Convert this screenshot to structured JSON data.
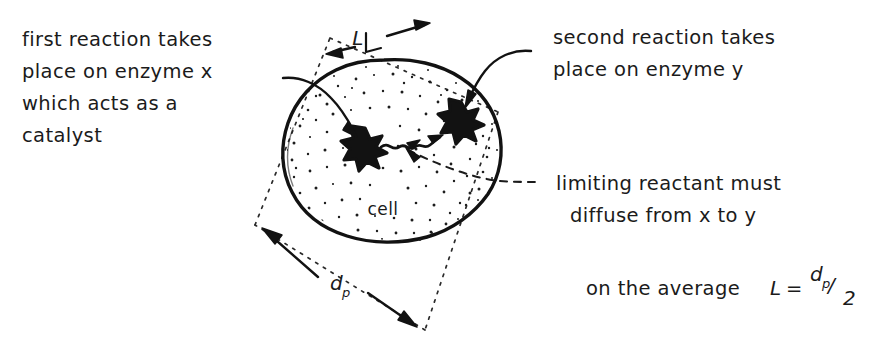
{
  "figure": {
    "ink_color": "#121212",
    "background_color": "#ffffff"
  },
  "annotations": {
    "left_note": {
      "name": "first-reaction-note",
      "lines": [
        "first reaction takes",
        "place on enzyme x",
        "which acts as a",
        "catalyst"
      ]
    },
    "right_note": {
      "name": "second-reaction-note",
      "lines": [
        "second reaction takes",
        "place on enzyme y"
      ]
    },
    "diffusion_note": {
      "name": "limiting-reactant-note",
      "lines": [
        "limiting reactant must",
        "diffuse from x to y"
      ]
    },
    "formula_note": {
      "name": "average-length-formula",
      "prefix": "on the average",
      "symbol": "L",
      "equals": "=",
      "numerator": "d",
      "numerator_sub": "p",
      "slash": "/",
      "denominator": "2"
    }
  },
  "diagram": {
    "cell_label": "cell",
    "dimension_L": "L",
    "dimension_dp_main": "d",
    "dimension_dp_sub": "p",
    "enzyme_x_name": "enzyme-x-star",
    "enzyme_y_name": "enzyme-y-star",
    "circle": {
      "cx": 385,
      "cy": 150,
      "r": 90
    },
    "bounding_box_rotation_deg": 20
  }
}
